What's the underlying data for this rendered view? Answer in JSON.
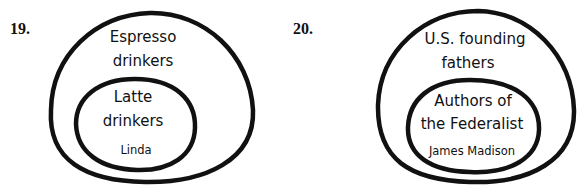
{
  "diagrams": [
    {
      "number": "19.",
      "outer_set": {
        "line1": "Espresso",
        "line2": "drinkers"
      },
      "inner_set": {
        "line1": "Latte",
        "line2": "drinkers"
      },
      "member": "Linda"
    },
    {
      "number": "20.",
      "outer_set": {
        "line1": "U.S. founding",
        "line2": "fathers"
      },
      "inner_set": {
        "line1": "Authors of",
        "line2": "the Federalist"
      },
      "member": "James Madison"
    }
  ],
  "colors": {
    "stroke": "#111111",
    "background": "#ffffff",
    "text": "#111111"
  }
}
